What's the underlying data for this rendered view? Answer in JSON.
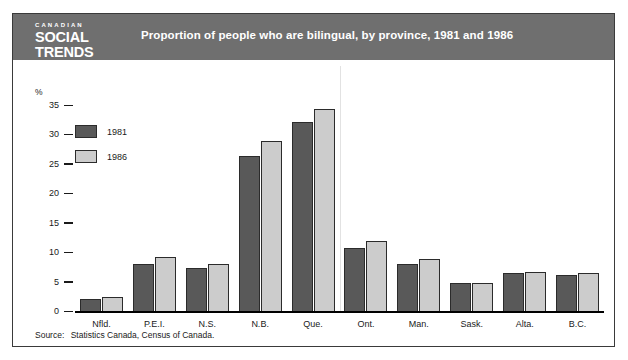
{
  "masthead": {
    "kicker": "CANADIAN",
    "line1": "SOCIAL",
    "line2": "TRENDS"
  },
  "header": {
    "title": "Proportion of people who are bilingual, by province, 1981 and 1986",
    "band_color": "#6f6f6f"
  },
  "source": {
    "lead": "Source:",
    "text": "Statistics Canada, Census of Canada."
  },
  "colors": {
    "series_1981": "#595959",
    "series_1986": "#cccccc",
    "bar_outline": "#2b2b2b",
    "axis": "#000000",
    "text": "#1a1a1a",
    "panel_border": "#3a3a3a"
  },
  "chart_data": {
    "type": "bar",
    "title": "Proportion of people who are bilingual, by province, 1981 and 1986",
    "xlabel": "",
    "ylabel": "%",
    "unit_label": "%",
    "ylim": [
      0,
      35
    ],
    "yticks": [
      35,
      30,
      25,
      20,
      15,
      10,
      5,
      0
    ],
    "ytick_labels": [
      "35",
      "30",
      "25",
      "20",
      "15",
      "10",
      "5",
      "0"
    ],
    "grid": false,
    "legend_position": "upper left inside",
    "categories": [
      "Nfld.",
      "P.E.I.",
      "N.S.",
      "N.B.",
      "Que.",
      "Ont.",
      "Man.",
      "Sask.",
      "Alta.",
      "B.C."
    ],
    "series": [
      {
        "name": "1981",
        "color": "#595959",
        "values": [
          2.2,
          8.1,
          7.4,
          26.5,
          32.3,
          10.8,
          8.2,
          5.0,
          6.7,
          6.3
        ]
      },
      {
        "name": "1986",
        "color": "#cccccc",
        "values": [
          2.5,
          9.4,
          8.1,
          29.0,
          34.5,
          12.0,
          9.0,
          5.0,
          6.8,
          6.6
        ]
      }
    ]
  }
}
